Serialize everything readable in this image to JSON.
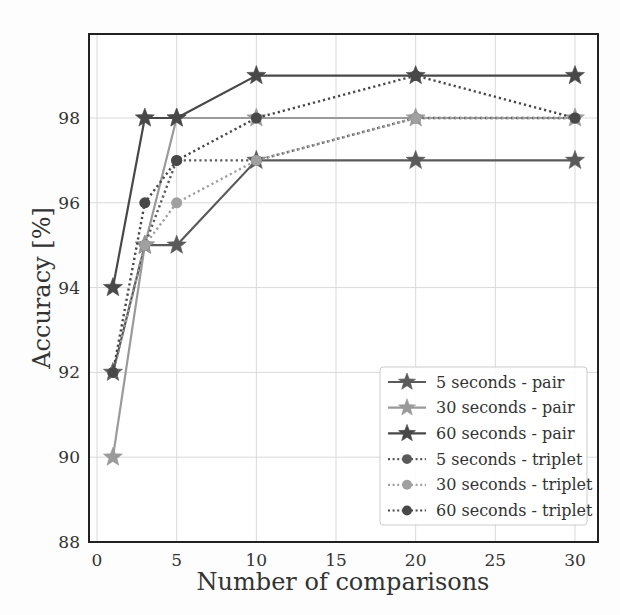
{
  "chart_data": {
    "type": "line",
    "title": "",
    "xlabel": "Number of comparisons",
    "ylabel": "Accuracy [%]",
    "x": [
      1,
      3,
      5,
      10,
      20,
      30
    ],
    "xlim": [
      -0.5,
      31.5
    ],
    "ylim": [
      88,
      99.8
    ],
    "xticks": [
      0,
      5,
      10,
      15,
      20,
      25,
      30
    ],
    "yticks": [
      88,
      90,
      92,
      94,
      96,
      98
    ],
    "grid": true,
    "legend_position": "lower right",
    "series": [
      {
        "name": "5 seconds - pair",
        "values": [
          92,
          95,
          95,
          97,
          97,
          97
        ],
        "color": "#5a5a5a",
        "linestyle": "solid",
        "marker": "star"
      },
      {
        "name": "30 seconds - pair",
        "values": [
          90,
          95,
          98,
          98,
          98,
          98
        ],
        "color": "#9a9a9a",
        "linestyle": "solid",
        "marker": "star"
      },
      {
        "name": "60 seconds - pair",
        "values": [
          94,
          98,
          98,
          99,
          99,
          99
        ],
        "color": "#484848",
        "linestyle": "solid",
        "marker": "star"
      },
      {
        "name": "5 seconds - triplet",
        "values": [
          92,
          95,
          97,
          97,
          98,
          98
        ],
        "color": "#5a5a5a",
        "linestyle": "dotted",
        "marker": "circle"
      },
      {
        "name": "30 seconds - triplet",
        "values": [
          92,
          95,
          96,
          97,
          98,
          98
        ],
        "color": "#a0a0a0",
        "linestyle": "dotted",
        "marker": "circle"
      },
      {
        "name": "60 seconds - triplet",
        "values": [
          92,
          96,
          97,
          98,
          99,
          98
        ],
        "color": "#484848",
        "linestyle": "dotted",
        "marker": "circle"
      }
    ]
  },
  "colors": {
    "background": "#ffffff",
    "grid": "#d9d9d9",
    "frame": "#222222",
    "legend_border": "#cccccc"
  }
}
